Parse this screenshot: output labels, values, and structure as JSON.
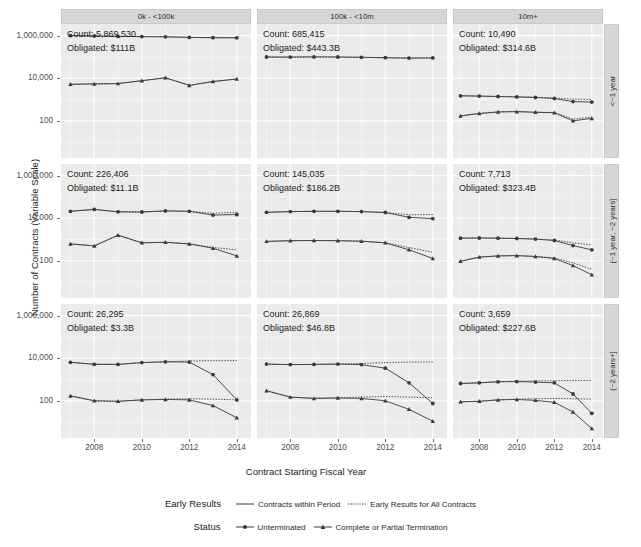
{
  "chart_data": {
    "type": "line",
    "title": "",
    "xlabel": "Contract Starting Fiscal Year",
    "ylabel": "Number of Contracts (Variable Scale)",
    "yscale": "log",
    "yticks": [
      "1,000,000",
      "10,000",
      "100"
    ],
    "ytick_values": [
      1000000,
      10000,
      100
    ],
    "xticks": [
      "2008",
      "2010",
      "2012",
      "2014"
    ],
    "xtick_values": [
      2008,
      2010,
      2012,
      2014
    ],
    "xlim": [
      2006.6,
      2014.6
    ],
    "x": [
      2007,
      2008,
      2009,
      2010,
      2011,
      2012,
      2013,
      2014
    ],
    "grid": true,
    "col_facets": [
      "0k - <100k",
      "100k - <10m",
      "10m+"
    ],
    "row_facets": [
      "<~1 year",
      "(~1 year, ~2 years]",
      "(~2 years+]"
    ],
    "legends": [
      {
        "title": "Early Results",
        "entries": [
          {
            "label": "Contracts within Period",
            "style": "solid"
          },
          {
            "label": "Early Results for All Contracts",
            "style": "dotted"
          }
        ]
      },
      {
        "title": "Status",
        "entries": [
          {
            "label": "Unterminated",
            "marker": "circle"
          },
          {
            "label": "Complete or Partial Termination",
            "marker": "triangle"
          }
        ]
      }
    ],
    "panels": [
      {
        "row": 0,
        "col": 0,
        "row_label": "<~1 year",
        "col_label": "0k - <100k",
        "count_label": "Count: 5,869,530",
        "obligated_label": "Obligated: $111B",
        "series": [
          {
            "name": "Unterminated / Contracts within Period",
            "marker": "circle",
            "style": "solid",
            "values": [
              1000000,
              960000,
              920000,
              900000,
              880000,
              820000,
              800000,
              790000
            ]
          },
          {
            "name": "Unterminated / Early Results for All Contracts",
            "marker": "circle",
            "style": "dotted",
            "values": [
              1000000,
              960000,
              920000,
              900000,
              880000,
              820000,
              800000,
              790000
            ]
          },
          {
            "name": "Complete or Partial Termination / Contracts within Period",
            "marker": "triangle",
            "style": "solid",
            "values": [
              5200,
              5400,
              5600,
              7600,
              10500,
              4600,
              7000,
              9200
            ]
          },
          {
            "name": "Complete or Partial Termination / Early Results for All Contracts",
            "marker": "triangle",
            "style": "dotted",
            "values": [
              5200,
              5400,
              5600,
              7600,
              10500,
              4600,
              7000,
              9200
            ]
          }
        ]
      },
      {
        "row": 0,
        "col": 1,
        "row_label": "<~1 year",
        "col_label": "100k - <10m",
        "count_label": "Count: 685,415",
        "obligated_label": "Obligated: $443.3B",
        "series": [
          {
            "name": "Unterminated / Contracts within Period",
            "marker": "circle",
            "style": "solid",
            "values": [
              99000,
              98000,
              100000,
              99000,
              96000,
              92000,
              88000,
              90000
            ]
          },
          {
            "name": "Unterminated / Early Results for All Contracts",
            "marker": "circle",
            "style": "dotted",
            "values": [
              99000,
              98000,
              100000,
              99000,
              96000,
              92000,
              88000,
              90000
            ]
          }
        ]
      },
      {
        "row": 0,
        "col": 2,
        "row_label": "<~1 year",
        "col_label": "10m+",
        "count_label": "Count: 10,490",
        "obligated_label": "Obligated: $314.6B",
        "series": [
          {
            "name": "Unterminated / Contracts within Period",
            "marker": "circle",
            "style": "solid",
            "values": [
              1500,
              1450,
              1380,
              1320,
              1250,
              1120,
              800,
              760
            ]
          },
          {
            "name": "Unterminated / Early Results for All Contracts",
            "marker": "circle",
            "style": "dotted",
            "values": [
              1500,
              1450,
              1390,
              1340,
              1280,
              1180,
              1050,
              1000
            ]
          },
          {
            "name": "Complete or Partial Termination / Contracts within Period",
            "marker": "triangle",
            "style": "solid",
            "values": [
              170,
              220,
              260,
              270,
              250,
              240,
              100,
              130
            ]
          },
          {
            "name": "Complete or Partial Termination / Early Results for All Contracts",
            "marker": "triangle",
            "style": "dotted",
            "values": [
              170,
              220,
              265,
              275,
              255,
              245,
              120,
              150
            ]
          }
        ]
      },
      {
        "row": 1,
        "col": 0,
        "row_label": "(~1 year, ~2 years]",
        "col_label": "0k - <100k",
        "count_label": "Count: 226,406",
        "obligated_label": "Obligated: $11.1B",
        "series": [
          {
            "name": "Unterminated / Contracts within Period",
            "marker": "circle",
            "style": "solid",
            "values": [
              21000,
              26000,
              20000,
              19500,
              22000,
              21000,
              14000,
              15000
            ]
          },
          {
            "name": "Unterminated / Early Results for All Contracts",
            "marker": "circle",
            "style": "dotted",
            "values": [
              21000,
              26000,
              20000,
              19500,
              22000,
              21000,
              17000,
              19000
            ]
          },
          {
            "name": "Complete or Partial Termination / Contracts within Period",
            "marker": "triangle",
            "style": "solid",
            "values": [
              620,
              500,
              1600,
              700,
              740,
              620,
              390,
              170
            ]
          },
          {
            "name": "Complete or Partial Termination / Early Results for All Contracts",
            "marker": "triangle",
            "style": "dotted",
            "values": [
              620,
              500,
              1600,
              700,
              740,
              620,
              420,
              330
            ]
          }
        ]
      },
      {
        "row": 1,
        "col": 1,
        "row_label": "(~1 year, ~2 years]",
        "col_label": "100k - <10m",
        "count_label": "Count: 145,035",
        "obligated_label": "Obligated: $186.2B",
        "series": [
          {
            "name": "Unterminated / Contracts within Period",
            "marker": "circle",
            "style": "solid",
            "values": [
              19000,
              20500,
              21000,
              21000,
              20500,
              18500,
              11000,
              9500
            ]
          },
          {
            "name": "Unterminated / Early Results for All Contracts",
            "marker": "circle",
            "style": "dotted",
            "values": [
              19000,
              20500,
              21000,
              21000,
              20500,
              18500,
              14500,
              15000
            ]
          },
          {
            "name": "Complete or Partial Termination / Contracts within Period",
            "marker": "triangle",
            "style": "solid",
            "values": [
              820,
              880,
              900,
              880,
              830,
              700,
              330,
              130
            ]
          },
          {
            "name": "Complete or Partial Termination / Early Results for All Contracts",
            "marker": "triangle",
            "style": "dotted",
            "values": [
              820,
              880,
              900,
              880,
              830,
              700,
              420,
              250
            ]
          }
        ]
      },
      {
        "row": 1,
        "col": 2,
        "row_label": "(~1 year, ~2 years]",
        "col_label": "10m+",
        "count_label": "Count: 7,713",
        "obligated_label": "Obligated: $323.4B",
        "series": [
          {
            "name": "Unterminated / Contracts within Period",
            "marker": "circle",
            "style": "solid",
            "values": [
              1150,
              1180,
              1150,
              1120,
              1050,
              900,
              520,
              330
            ]
          },
          {
            "name": "Unterminated / Early Results for All Contracts",
            "marker": "circle",
            "style": "dotted",
            "values": [
              1150,
              1180,
              1150,
              1120,
              1050,
              950,
              700,
              560
            ]
          },
          {
            "name": "Complete or Partial Termination / Contracts within Period",
            "marker": "triangle",
            "style": "solid",
            "values": [
              95,
              150,
              170,
              175,
              160,
              130,
              60,
              22
            ]
          },
          {
            "name": "Complete or Partial Termination / Early Results for All Contracts",
            "marker": "triangle",
            "style": "dotted",
            "values": [
              95,
              150,
              170,
              175,
              160,
              135,
              80,
              40
            ]
          }
        ]
      },
      {
        "row": 2,
        "col": 0,
        "row_label": "(~2 years+]",
        "col_label": "0k - <100k",
        "count_label": "Count: 26,295",
        "obligated_label": "Obligated: $3.3B",
        "series": [
          {
            "name": "Unterminated / Contracts within Period",
            "marker": "circle",
            "style": "solid",
            "values": [
              6400,
              5200,
              5100,
              6200,
              6800,
              6600,
              1700,
              110
            ]
          },
          {
            "name": "Unterminated / Early Results for All Contracts",
            "marker": "circle",
            "style": "dotted",
            "values": [
              6400,
              5200,
              5100,
              6200,
              6800,
              7400,
              7600,
              7700
            ]
          },
          {
            "name": "Complete or Partial Termination / Contracts within Period",
            "marker": "triangle",
            "style": "solid",
            "values": [
              170,
              100,
              95,
              110,
              115,
              110,
              60,
              16
            ]
          },
          {
            "name": "Complete or Partial Termination / Early Results for All Contracts",
            "marker": "triangle",
            "style": "dotted",
            "values": [
              170,
              100,
              95,
              110,
              120,
              125,
              120,
              110
            ]
          }
        ]
      },
      {
        "row": 2,
        "col": 1,
        "row_label": "(~2 years+]",
        "col_label": "100k - <10m",
        "count_label": "Count: 26,869",
        "obligated_label": "Obligated: $46.8B",
        "series": [
          {
            "name": "Unterminated / Contracts within Period",
            "marker": "circle",
            "style": "solid",
            "values": [
              5300,
              5000,
              5100,
              5300,
              5000,
              3400,
              700,
              75
            ]
          },
          {
            "name": "Unterminated / Early Results for All Contracts",
            "marker": "circle",
            "style": "dotted",
            "values": [
              5300,
              5000,
              5100,
              5400,
              5600,
              6200,
              6600,
              6700
            ]
          },
          {
            "name": "Complete or Partial Termination / Contracts within Period",
            "marker": "triangle",
            "style": "solid",
            "values": [
              300,
              150,
              130,
              135,
              130,
              100,
              40,
              11
            ]
          },
          {
            "name": "Complete or Partial Termination / Early Results for All Contracts",
            "marker": "triangle",
            "style": "dotted",
            "values": [
              300,
              150,
              130,
              140,
              150,
              160,
              150,
              140
            ]
          }
        ]
      },
      {
        "row": 2,
        "col": 2,
        "row_label": "(~2 years+]",
        "col_label": "10m+",
        "count_label": "Count: 3,659",
        "obligated_label": "Obligated: $227.6B",
        "series": [
          {
            "name": "Unterminated / Contracts within Period",
            "marker": "circle",
            "style": "solid",
            "values": [
              650,
              700,
              780,
              800,
              760,
              700,
              210,
              26
            ]
          },
          {
            "name": "Unterminated / Early Results for All Contracts",
            "marker": "circle",
            "style": "dotted",
            "values": [
              650,
              700,
              790,
              830,
              860,
              880,
              900,
              910
            ]
          },
          {
            "name": "Complete or Partial Termination / Contracts within Period",
            "marker": "triangle",
            "style": "solid",
            "values": [
              90,
              95,
              110,
              115,
              105,
              85,
              30,
              5
            ]
          },
          {
            "name": "Complete or Partial Termination / Early Results for All Contracts",
            "marker": "triangle",
            "style": "dotted",
            "values": [
              90,
              95,
              110,
              120,
              125,
              130,
              125,
              120
            ]
          }
        ]
      }
    ]
  },
  "colors": {
    "panel_bg": "#ebebeb",
    "strip_bg": "#d6d6d6",
    "grid_major": "#ffffff",
    "grid_minor": "#f5f5f5",
    "series": "#3a3a3a",
    "text": "#1a1a1a"
  }
}
